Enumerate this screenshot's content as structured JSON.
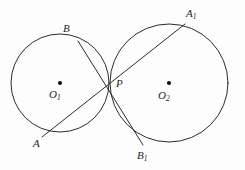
{
  "figure": {
    "kind": "geometry-diagram",
    "background_color": "#fdfdfd",
    "stroke_color": "#2b2b2b",
    "label_color": "#262626",
    "width": 245,
    "height": 170
  },
  "circles": [
    {
      "id": "circle-left",
      "center_label": "O",
      "center_subscript": "1",
      "cx": 60,
      "cy": 83,
      "r": 49
    },
    {
      "id": "circle-right",
      "center_label": "O",
      "center_subscript": "2",
      "cx": 169,
      "cy": 83,
      "r": 59
    }
  ],
  "points": [
    {
      "id": "point-B",
      "label": "B",
      "subscript": "",
      "x": 78,
      "y": 41
    },
    {
      "id": "point-A",
      "label": "A",
      "subscript": "",
      "x": 42,
      "y": 137
    },
    {
      "id": "point-A1",
      "label": "A",
      "subscript": "1",
      "x": 185,
      "y": 24
    },
    {
      "id": "point-B1",
      "label": "B",
      "subscript": "1",
      "x": 143,
      "y": 145
    },
    {
      "id": "point-P",
      "label": "P",
      "subscript": "",
      "x": 110,
      "y": 83
    },
    {
      "id": "point-O1",
      "label": "O",
      "subscript": "1",
      "x": 60,
      "y": 83
    },
    {
      "id": "point-O2",
      "label": "O",
      "subscript": "2",
      "x": 169,
      "y": 83
    }
  ],
  "segments": [
    {
      "id": "secant-A-A1",
      "from": "A",
      "through": "P",
      "to": "A1",
      "x1": 42,
      "y1": 137,
      "x2": 185,
      "y2": 24
    },
    {
      "id": "secant-B-B1",
      "from": "B",
      "through": "P",
      "to": "B1",
      "x1": 78,
      "y1": 41,
      "x2": 143,
      "y2": 145
    }
  ],
  "labels": {
    "B": {
      "text": "B",
      "sub": ""
    },
    "A": {
      "text": "A",
      "sub": ""
    },
    "A1": {
      "text": "A",
      "sub": "1"
    },
    "B1": {
      "text": "B",
      "sub": "1"
    },
    "P": {
      "text": "P",
      "sub": ""
    },
    "O1": {
      "text": "O",
      "sub": "1"
    },
    "O2": {
      "text": "O",
      "sub": "2"
    }
  }
}
